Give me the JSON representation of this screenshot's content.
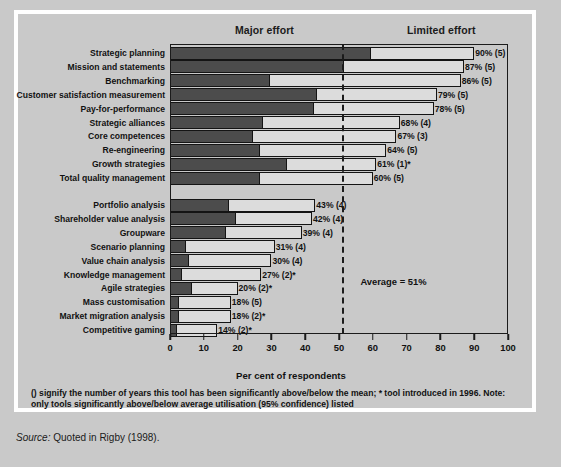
{
  "header": {
    "major_effort": "Major effort",
    "limited_effort": "Limited effort"
  },
  "annotation": {
    "average": "Average = 51%"
  },
  "axis": {
    "title": "Per cent of respondents",
    "ticks": [
      "0",
      "10",
      "20",
      "30",
      "40",
      "50",
      "60",
      "70",
      "80",
      "90",
      "100"
    ]
  },
  "footnote": "() signify the number of years this tool has been significantly above/below the mean; * tool introduced in 1996. Note: only tools significantly above/below average utilisation (95% confidence) listed",
  "source": {
    "prefix": "Source:",
    "text": "Quoted in Rigby (1998)."
  },
  "chart_data": {
    "type": "bar",
    "orientation": "horizontal",
    "stacked": true,
    "title": "",
    "xlabel": "Per cent of respondents",
    "ylabel": "",
    "xlim": [
      0,
      100
    ],
    "grid": false,
    "legend_position": "top",
    "series": [
      {
        "name": "Major effort",
        "color": "#4c4c4c"
      },
      {
        "name": "Limited effort",
        "color": "#dcdcdc"
      }
    ],
    "reference_line": {
      "label": "Average = 51%",
      "value": 51,
      "style": "dashed"
    },
    "group_break_after": "Total quality management",
    "categories": [
      "Strategic planning",
      "Mission and statements",
      "Benchmarking",
      "Customer satisfaction measurement",
      "Pay-for-performance",
      "Strategic alliances",
      "Core competences",
      "Re-engineering",
      "Growth strategies",
      "Total quality management",
      "Portfolio analysis",
      "Shareholder value analysis",
      "Groupware",
      "Scenario planning",
      "Value chain analysis",
      "Knowledge management",
      "Agile strategies",
      "Mass customisation",
      "Market migration analysis",
      "Competitive gaming"
    ],
    "totals": [
      90,
      87,
      86,
      79,
      78,
      68,
      67,
      64,
      61,
      60,
      43,
      42,
      39,
      31,
      30,
      27,
      20,
      18,
      18,
      14
    ],
    "major_effort": [
      59,
      51,
      29,
      43,
      42,
      27,
      24,
      26,
      34,
      26,
      17,
      19,
      16,
      4,
      5,
      3,
      6,
      2,
      2,
      1.5
    ],
    "data_labels": [
      "90% (5)",
      "87% (5)",
      "86% (5)",
      "79% (5)",
      "78% (5)",
      "68% (4)",
      "67% (3)",
      "64% (5)",
      "61% (1)*",
      "60% (5)",
      "43%  (4)",
      "42% (4)",
      "39% (4)",
      "31% (4)",
      "30% (4)",
      "27% (2)*",
      "20% (2)*",
      "18% (5)",
      "18% (2)*",
      "14% (2)*"
    ]
  }
}
